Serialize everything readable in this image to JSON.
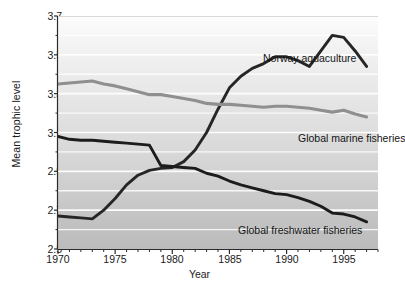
{
  "chart_data": {
    "type": "line",
    "title": "",
    "xlabel": "Year",
    "ylabel": "Mean trophic level",
    "xlim": [
      1970,
      1998
    ],
    "ylim": [
      2.5,
      3.7
    ],
    "xticks": [
      1970,
      1975,
      1980,
      1985,
      1990,
      1995
    ],
    "yticks": [
      2.5,
      2.7,
      2.9,
      3.1,
      3.3,
      3.5,
      3.7
    ],
    "yticks_minor": [
      2.6,
      2.8,
      3.0,
      3.2,
      3.4,
      3.6
    ],
    "grid": true,
    "legend_position": "inline-annotations",
    "series": [
      {
        "name": "Norway aquaculture",
        "color": "#262626",
        "x": [
          1970,
          1971,
          1972,
          1973,
          1974,
          1975,
          1976,
          1977,
          1978,
          1979,
          1980,
          1981,
          1982,
          1983,
          1984,
          1985,
          1986,
          1987,
          1988,
          1989,
          1990,
          1991,
          1992,
          1993,
          1994,
          1995,
          1996,
          1997
        ],
        "values": [
          2.67,
          2.665,
          2.66,
          2.655,
          2.7,
          2.76,
          2.83,
          2.88,
          2.905,
          2.915,
          2.92,
          2.95,
          3.01,
          3.1,
          3.22,
          3.33,
          3.39,
          3.43,
          3.455,
          3.49,
          3.49,
          3.47,
          3.44,
          3.52,
          3.6,
          3.59,
          3.52,
          3.44
        ]
      },
      {
        "name": "Global marine fisheries",
        "color": "#8f8f8f",
        "x": [
          1970,
          1971,
          1972,
          1973,
          1974,
          1975,
          1976,
          1977,
          1978,
          1979,
          1980,
          1981,
          1982,
          1983,
          1984,
          1985,
          1986,
          1987,
          1988,
          1989,
          1990,
          1991,
          1992,
          1993,
          1994,
          1995,
          1996,
          1997
        ],
        "values": [
          3.35,
          3.355,
          3.36,
          3.365,
          3.35,
          3.34,
          3.325,
          3.31,
          3.295,
          3.295,
          3.285,
          3.275,
          3.265,
          3.25,
          3.245,
          3.245,
          3.24,
          3.235,
          3.23,
          3.235,
          3.235,
          3.23,
          3.225,
          3.215,
          3.205,
          3.215,
          3.195,
          3.18
        ]
      },
      {
        "name": "Global freshwater fisheries",
        "color": "#1c1c1c",
        "x": [
          1970,
          1971,
          1972,
          1973,
          1974,
          1975,
          1976,
          1977,
          1978,
          1979,
          1980,
          1981,
          1982,
          1983,
          1984,
          1985,
          1986,
          1987,
          1988,
          1989,
          1990,
          1991,
          1992,
          1993,
          1994,
          1995,
          1996,
          1997
        ],
        "values": [
          3.08,
          3.065,
          3.06,
          3.06,
          3.055,
          3.05,
          3.045,
          3.04,
          3.035,
          2.93,
          2.925,
          2.92,
          2.915,
          2.89,
          2.875,
          2.85,
          2.83,
          2.815,
          2.8,
          2.785,
          2.78,
          2.765,
          2.745,
          2.72,
          2.685,
          2.68,
          2.665,
          2.64
        ]
      }
    ]
  }
}
